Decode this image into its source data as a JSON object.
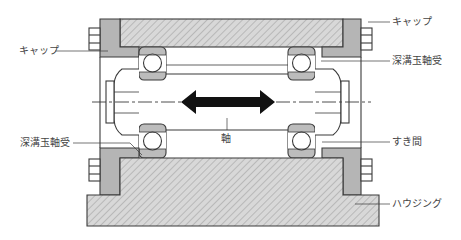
{
  "diagram": {
    "colors": {
      "outline": "#3a3a3a",
      "cap_fill": "#b5b5b5",
      "hatch_fill": "#d6d6d6",
      "hatch_line": "#b0b0b0",
      "bearing_ring": "#bcbcbc",
      "arrow": "#111111",
      "label_text": "#444444"
    },
    "labels": {
      "cap_left": "キャップ",
      "cap_right": "キャップ",
      "bearing_right": "深溝玉軸受",
      "bearing_left": "深溝玉軸受",
      "shaft": "軸",
      "clearance": "すき間",
      "housing": "ハウジング"
    },
    "annotations": {
      "axial_motion_arrow": "double-headed arrow indicating shaft axial movement"
    }
  }
}
